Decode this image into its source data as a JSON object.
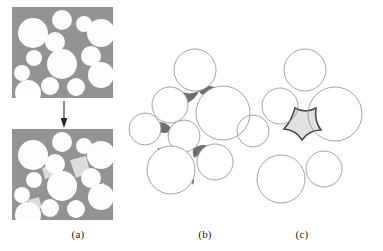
{
  "figure": {
    "width": 383,
    "height": 251,
    "background": "#ffffff"
  },
  "captions": {
    "a": "(a)",
    "b": "(b)",
    "c": "(c)"
  },
  "colors": {
    "matrix_gray": "#939393",
    "particle_white": "#fdfdfd",
    "neck_light_gray": "#dcdcdc",
    "interstice_dark_gray": "#6f6f6f",
    "pore_fill": "#e2e2e2",
    "outline_light": "#9a9a9a",
    "outline_dark": "#4a4a4a",
    "caption_text": "#1a1a1a",
    "arrow": "#2a2a2a"
  },
  "panel_a": {
    "name": "two-stage-packing",
    "arrow": {
      "x": 64,
      "y_start": 101,
      "y_end": 127
    },
    "top_box": {
      "x": 12,
      "y": 7,
      "w": 101,
      "h": 91
    },
    "bottom_box": {
      "x": 12,
      "y": 129,
      "w": 101,
      "h": 91
    },
    "circles": [
      {
        "cx": 33,
        "cy": 33,
        "r": 15
      },
      {
        "cx": 62,
        "cy": 20,
        "r": 10
      },
      {
        "cx": 84,
        "cy": 24,
        "r": 8
      },
      {
        "cx": 101,
        "cy": 33,
        "r": 14
      },
      {
        "cx": 55,
        "cy": 42,
        "r": 10
      },
      {
        "cx": 34,
        "cy": 58,
        "r": 8
      },
      {
        "cx": 62,
        "cy": 64,
        "r": 15
      },
      {
        "cx": 91,
        "cy": 56,
        "r": 10
      },
      {
        "cx": 22,
        "cy": 73,
        "r": 8
      },
      {
        "cx": 101,
        "cy": 75,
        "r": 13
      },
      {
        "cx": 50,
        "cy": 86,
        "r": 9
      },
      {
        "cx": 76,
        "cy": 87,
        "r": 9
      },
      {
        "cx": 28,
        "cy": 93,
        "r": 13
      }
    ],
    "necks": [
      {
        "x": 72,
        "y": 48,
        "w": 14,
        "h": 14
      },
      {
        "x": 44,
        "y": 72,
        "w": 12,
        "h": 12
      },
      {
        "x": 84,
        "y": 68,
        "w": 11,
        "h": 11
      },
      {
        "x": 40,
        "y": 48,
        "w": 10,
        "h": 10
      }
    ]
  },
  "panel_b": {
    "name": "tangent-packing-with-interstices",
    "circles": [
      {
        "cx": 195,
        "cy": 70,
        "r": 21,
        "label": "top"
      },
      {
        "cx": 170,
        "cy": 105,
        "r": 18,
        "label": "upper-left"
      },
      {
        "cx": 223,
        "cy": 113,
        "r": 27,
        "label": "right-large"
      },
      {
        "cx": 145,
        "cy": 129,
        "r": 16,
        "label": "left"
      },
      {
        "cx": 184,
        "cy": 136,
        "r": 16,
        "label": "center"
      },
      {
        "cx": 171,
        "cy": 170,
        "r": 24,
        "label": "bottom-left"
      },
      {
        "cx": 215,
        "cy": 162,
        "r": 18,
        "label": "bottom-right"
      }
    ]
  },
  "panel_c": {
    "name": "separated-packing-with-pore",
    "circles": [
      {
        "cx": 305,
        "cy": 70,
        "r": 21,
        "label": "top"
      },
      {
        "cx": 280,
        "cy": 106,
        "r": 18,
        "label": "upper-left"
      },
      {
        "cx": 335,
        "cy": 114,
        "r": 27,
        "label": "right-large"
      },
      {
        "cx": 253,
        "cy": 131,
        "r": 16,
        "label": "left"
      },
      {
        "cx": 281,
        "cy": 179,
        "r": 24,
        "label": "bottom-left"
      },
      {
        "cx": 324,
        "cy": 169,
        "r": 18,
        "label": "bottom-right"
      }
    ],
    "pore": {
      "label": "central-pore",
      "fill": "#e2e2e2",
      "stroke": "#4a4a4a"
    }
  }
}
